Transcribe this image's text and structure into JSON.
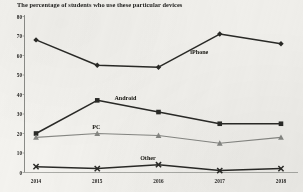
{
  "chart_data": {
    "type": "line",
    "title": "The percentage of students who use these particular devices",
    "xlabel": "",
    "ylabel": "",
    "categories": [
      "2014",
      "2015",
      "2016",
      "2017",
      "2018"
    ],
    "yticks": [
      "0",
      "10",
      "20",
      "30",
      "40",
      "50",
      "60",
      "70",
      "80"
    ],
    "ylim": [
      0,
      80
    ],
    "grid": false,
    "legend_position": "inline-annotations",
    "series": [
      {
        "name": "iPhone",
        "values": [
          68,
          55,
          54,
          71,
          66
        ],
        "marker": "diamond",
        "color": "#2a2a27"
      },
      {
        "name": "Android",
        "values": [
          20,
          37,
          31,
          25,
          25
        ],
        "marker": "square",
        "color": "#2a2a27"
      },
      {
        "name": "PC",
        "values": [
          18,
          20,
          19,
          15,
          18
        ],
        "marker": "triangle",
        "color": "#878884"
      },
      {
        "name": "Other",
        "values": [
          3,
          2,
          4,
          1,
          2
        ],
        "marker": "x",
        "color": "#2a2a27"
      }
    ],
    "annotations": [
      {
        "text": "iPhone",
        "x": 2.52,
        "y": 61.5
      },
      {
        "text": "Android",
        "x": 1.28,
        "y": 37.5
      },
      {
        "text": "PC",
        "x": 0.92,
        "y": 23.0
      },
      {
        "text": "Other",
        "x": 1.7,
        "y": 7.0
      }
    ]
  },
  "axes": {
    "axis_color": "#7c7d79",
    "background": "#f4f3ef"
  }
}
